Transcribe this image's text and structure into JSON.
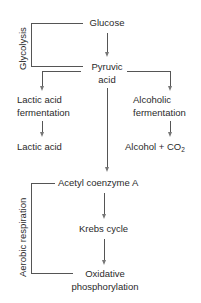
{
  "diagram": {
    "type": "metabolic-pathway-flowchart",
    "nodes": {
      "glucose": "Glucose",
      "pyruvic_line1": "Pyruvic",
      "pyruvic_line2": "acid",
      "lactic_fermentation_line1": "Lactic acid",
      "lactic_fermentation_line2": "fermentation",
      "lactic_acid": "Lactic acid",
      "alcoholic_fermentation_line1": "Alcoholic",
      "alcoholic_fermentation_line2": "fermentation",
      "alcohol_co2_prefix": "Alcohol + CO",
      "alcohol_co2_sub": "2",
      "acetyl_coa": "Acetyl coenzyme A",
      "krebs": "Krebs cycle",
      "oxidative_line1": "Oxidative",
      "oxidative_line2": "phosphorylation"
    },
    "brackets": {
      "glycolysis": "Glycolysis",
      "aerobic": "Aerobic  respiration"
    },
    "edges": [
      {
        "from": "Glucose",
        "to": "Pyruvic acid"
      },
      {
        "from": "Pyruvic acid",
        "to": "Lactic acid fermentation"
      },
      {
        "from": "Pyruvic acid",
        "to": "Alcoholic fermentation"
      },
      {
        "from": "Pyruvic acid",
        "to": "Acetyl coenzyme A"
      },
      {
        "from": "Lactic acid fermentation",
        "to": "Lactic acid"
      },
      {
        "from": "Alcoholic fermentation",
        "to": "Alcohol + CO2"
      },
      {
        "from": "Acetyl coenzyme A",
        "to": "Krebs cycle"
      },
      {
        "from": "Krebs cycle",
        "to": "Oxidative phosphorylation"
      }
    ],
    "colors": {
      "line": "#555555",
      "arrow": "#777777",
      "text": "#2a2a2a",
      "background": "#ffffff"
    }
  }
}
